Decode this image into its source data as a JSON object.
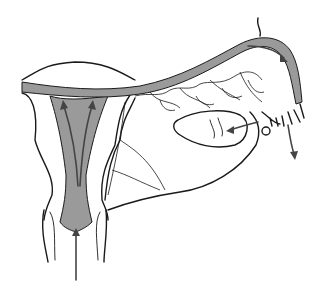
{
  "figure": {
    "colors": {
      "outline": "#1a1a1a",
      "shading": "#9a9a9a",
      "arrows": "#444444",
      "background": "#ffffff"
    },
    "labels": []
  }
}
